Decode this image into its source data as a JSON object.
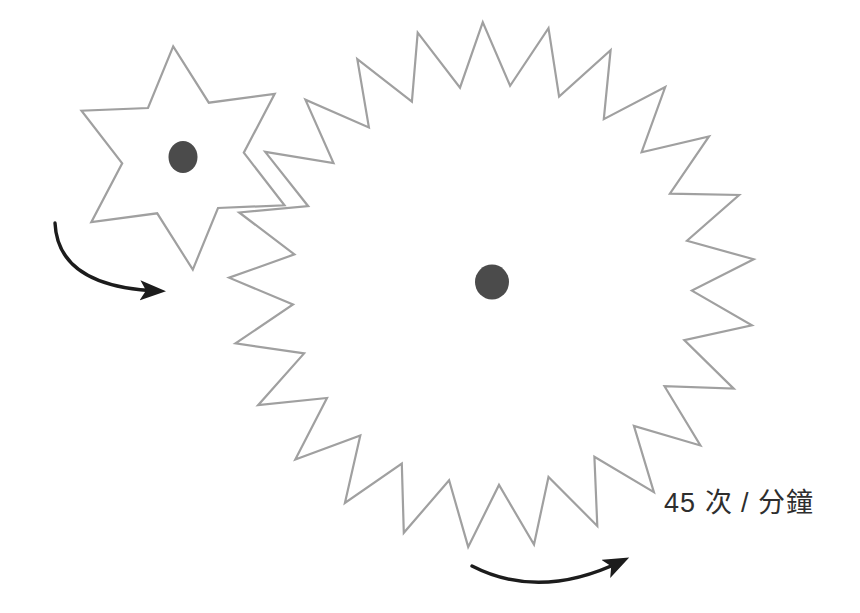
{
  "figure": {
    "background": "#ffffff",
    "speed_label": {
      "text": "45 次 / 分鐘",
      "color": "#2e2e2e"
    },
    "colors": {
      "gear_outline": "#a0a0a0",
      "hub_fill": "#4b4b4b",
      "arrow": "#1c1c1c"
    },
    "gears": [
      {
        "id": "gear-large",
        "name": "large-gear",
        "teeth": 25,
        "center": {
          "x": 492,
          "y": 285
        },
        "outer_radius": 263,
        "inner_radius": 200,
        "phase_deg": 92,
        "hub": {
          "cx": 492,
          "cy": 282,
          "rx": 17,
          "ry": 17.5
        },
        "rotation": "counterclockwise"
      },
      {
        "id": "gear-small",
        "name": "small-gear",
        "teeth": 6,
        "center": {
          "x": 183,
          "y": 158
        },
        "outer_radius": 112,
        "inner_radius": 61,
        "phase_deg": 95,
        "hub": {
          "cx": 183,
          "cy": 157,
          "rx": 14.5,
          "ry": 16
        },
        "rotation": "clockwise"
      }
    ],
    "arrows": [
      {
        "id": "arrow-small-gear",
        "path": "M 55 223 Q 58 287 158 291",
        "direction": "clockwise"
      },
      {
        "id": "arrow-large-gear",
        "path": "M 472 566 Q 540 601 622 561",
        "direction": "counterclockwise"
      }
    ]
  }
}
